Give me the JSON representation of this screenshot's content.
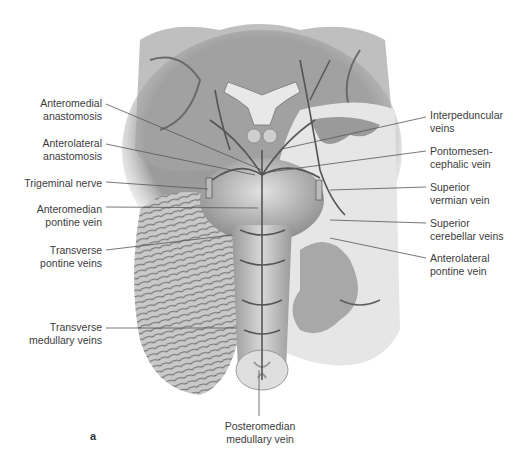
{
  "figure": {
    "panel_letter": "a",
    "colors": {
      "background": "#ffffff",
      "label_text": "#3c3c3c",
      "leader_line": "#555555"
    },
    "labels_left": [
      {
        "id": "anteromedial-anastomosis",
        "text": "Anteromedial\nanastomosis",
        "x": 4,
        "y": 97,
        "w": 98,
        "line": [
          106,
          104,
          262,
          170
        ]
      },
      {
        "id": "anterolateral-anastomosis",
        "text": "Anterolateral\nanastomosis",
        "x": 4,
        "y": 137,
        "w": 98,
        "line": [
          106,
          144,
          255,
          175
        ]
      },
      {
        "id": "trigeminal-nerve",
        "text": "Trigeminal nerve",
        "x": 4,
        "y": 177,
        "w": 98,
        "line": [
          106,
          182,
          208,
          189
        ]
      },
      {
        "id": "anteromedian-pontine-vein",
        "text": "Anteromedian\npontine vein",
        "x": 4,
        "y": 203,
        "w": 98,
        "line": [
          106,
          207,
          258,
          208
        ]
      },
      {
        "id": "transverse-pontine-veins",
        "text": "Transverse\npontine veins",
        "x": 4,
        "y": 244,
        "w": 98,
        "line": [
          106,
          250,
          232,
          235
        ]
      },
      {
        "id": "transverse-medullary-veins",
        "text": "Transverse\nmedullary veins",
        "x": 4,
        "y": 321,
        "w": 98,
        "line": [
          106,
          328,
          237,
          328
        ]
      }
    ],
    "labels_right": [
      {
        "id": "interpeduncular-veins",
        "text": "Interpeduncular\nveins",
        "x": 430,
        "y": 109,
        "line": [
          426,
          117,
          282,
          149
        ]
      },
      {
        "id": "pontomesencephalic-vein",
        "text": "Pontomesen-\ncephalic vein",
        "x": 430,
        "y": 145,
        "line": [
          426,
          151,
          262,
          173
        ]
      },
      {
        "id": "superior-vermian-vein",
        "text": "Superior\nvermian vein",
        "x": 430,
        "y": 181,
        "line": [
          426,
          187,
          330,
          190
        ]
      },
      {
        "id": "superior-cerebellar-veins",
        "text": "Superior\ncerebellar veins",
        "x": 430,
        "y": 217,
        "line": [
          426,
          223,
          330,
          220
        ]
      },
      {
        "id": "anterolateral-pontine-vein",
        "text": "Anterolateral\npontine vein",
        "x": 430,
        "y": 252,
        "line": [
          426,
          258,
          330,
          238
        ]
      }
    ],
    "labels_bottom": [
      {
        "id": "posteromedian-medullary-vein",
        "text": "Posteromedian\nmedullary vein",
        "x": 204,
        "y": 420,
        "w": 112,
        "line": [
          259,
          416,
          259,
          370
        ]
      }
    ]
  }
}
